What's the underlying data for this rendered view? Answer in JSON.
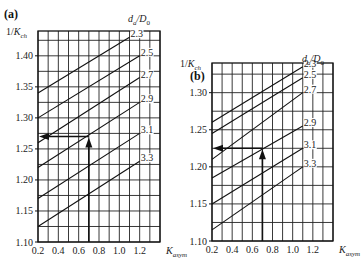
{
  "chart_data": [
    {
      "panel": "(a)",
      "type": "line",
      "ylabel": "1/K_ch",
      "xlabel": "K_asym",
      "legend_title": "d_a/D_0",
      "xlim": [
        0.2,
        1.4
      ],
      "ylim": [
        1.1,
        1.44
      ],
      "xticks": [
        0.2,
        0.4,
        0.6,
        0.8,
        1.0,
        1.2
      ],
      "yticks": [
        1.1,
        1.15,
        1.2,
        1.25,
        1.3,
        1.35,
        1.4
      ],
      "grid": true,
      "series": [
        {
          "name": "2.3",
          "x": [
            0.2,
            1.1
          ],
          "y": [
            1.34,
            1.43
          ]
        },
        {
          "name": "2.5",
          "x": [
            0.2,
            1.2
          ],
          "y": [
            1.3,
            1.4
          ]
        },
        {
          "name": "2.7",
          "x": [
            0.2,
            1.2
          ],
          "y": [
            1.26,
            1.365
          ]
        },
        {
          "name": "2.9",
          "x": [
            0.2,
            1.2
          ],
          "y": [
            1.22,
            1.325
          ]
        },
        {
          "name": "3.1",
          "x": [
            0.2,
            1.2
          ],
          "y": [
            1.17,
            1.275
          ]
        },
        {
          "name": "3.3",
          "x": [
            0.2,
            1.2
          ],
          "y": [
            1.125,
            1.23
          ]
        }
      ],
      "annotation": {
        "x": 0.7,
        "y": 1.27,
        "description": "arrow up from K_asym=0.7 to curve, then left to 1/K_ch axis"
      }
    },
    {
      "panel": "(b)",
      "type": "line",
      "ylabel": "1/K_ch",
      "xlabel": "K_asym",
      "legend_title": "d_a/D_0",
      "xlim": [
        0.2,
        1.4
      ],
      "ylim": [
        1.1,
        1.34
      ],
      "xticks": [
        0.2,
        0.4,
        0.6,
        0.8,
        1.0,
        1.2
      ],
      "yticks": [
        1.1,
        1.15,
        1.2,
        1.25,
        1.3
      ],
      "grid": true,
      "series": [
        {
          "name": "2.3",
          "x": [
            0.2,
            1.1
          ],
          "y": [
            1.26,
            1.335
          ]
        },
        {
          "name": "2.5",
          "x": [
            0.2,
            1.1
          ],
          "y": [
            1.245,
            1.32
          ]
        },
        {
          "name": "2.7",
          "x": [
            0.2,
            1.1
          ],
          "y": [
            1.21,
            1.3
          ]
        },
        {
          "name": "2.9",
          "x": [
            0.2,
            1.1
          ],
          "y": [
            1.185,
            1.255
          ]
        },
        {
          "name": "3.1",
          "x": [
            0.2,
            1.1
          ],
          "y": [
            1.15,
            1.225
          ]
        },
        {
          "name": "3.3",
          "x": [
            0.2,
            1.1
          ],
          "y": [
            1.115,
            1.2
          ]
        }
      ],
      "annotation": {
        "x": 0.7,
        "y": 1.225,
        "description": "arrow up from K_asym=0.7 to curve, then left to 1/K_ch axis"
      }
    }
  ],
  "labels": {
    "a": {
      "panel": "(a)",
      "ylabel_main": "1/K",
      "ylabel_sub": "ch",
      "xlabel_main": "K",
      "xlabel_sub": "asym",
      "legend_main": "d",
      "legend_sub": "a",
      "legend_rest": "/D",
      "legend_sub2": "0"
    },
    "b": {
      "panel": "(b)",
      "ylabel_main": "1/K",
      "ylabel_sub": "ch",
      "xlabel_main": "K",
      "xlabel_sub": "asym",
      "legend_main": "d",
      "legend_sub": "a",
      "legend_rest": "/D",
      "legend_sub2": "0"
    }
  }
}
